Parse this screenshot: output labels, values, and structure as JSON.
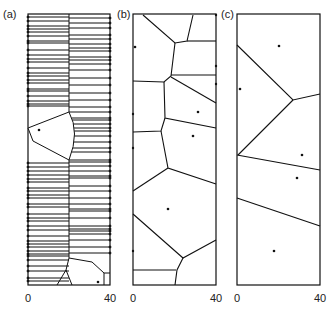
{
  "figure": {
    "panels": [
      {
        "id": "a",
        "label": "(a)",
        "x_ticks": [
          "0",
          "40"
        ]
      },
      {
        "id": "b",
        "label": "(b)",
        "x_ticks": [
          "0",
          "40"
        ]
      },
      {
        "id": "c",
        "label": "(c)",
        "x_ticks": [
          "0",
          "40"
        ]
      }
    ],
    "colors": {
      "line": "#111111",
      "background": "#ffffff"
    }
  }
}
